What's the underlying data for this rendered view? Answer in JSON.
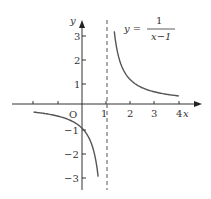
{
  "chart_data": {
    "type": "line",
    "title": "",
    "equation": {
      "lhs": "y =",
      "numerator": "1",
      "denominator": "x−1"
    },
    "xlabel": "x",
    "ylabel": "y",
    "origin_label": "O",
    "xlim": [
      -3,
      4.6
    ],
    "ylim": [
      -3.5,
      3.5
    ],
    "x_ticks": [
      -2,
      -1,
      1,
      2,
      3,
      4
    ],
    "x_tick_labels": [
      "1",
      "2",
      "3",
      "4"
    ],
    "y_ticks": [
      -3,
      -2,
      -1,
      1,
      2,
      3
    ],
    "y_tick_labels": [
      "3",
      "2",
      "1",
      "−1",
      "−2",
      "−3"
    ],
    "asymptote": {
      "x": 1,
      "style": "dashed"
    },
    "grid": false,
    "series": [
      {
        "name": "left branch",
        "x_range": [
          -2,
          0.6667
        ],
        "function": "1/(x-1)"
      },
      {
        "name": "right branch",
        "x_range": [
          1.3333,
          4
        ],
        "function": "1/(x-1)"
      }
    ],
    "color": "#555555"
  }
}
